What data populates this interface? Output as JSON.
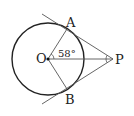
{
  "diagram": {
    "type": "geometry",
    "labels": {
      "center": "O",
      "tangent_point_top": "A",
      "tangent_point_bottom": "B",
      "external_point": "P",
      "angle": "58°"
    },
    "colors": {
      "circle": "#222222",
      "tangent_lines": "#555555",
      "segments": "#555555"
    }
  }
}
